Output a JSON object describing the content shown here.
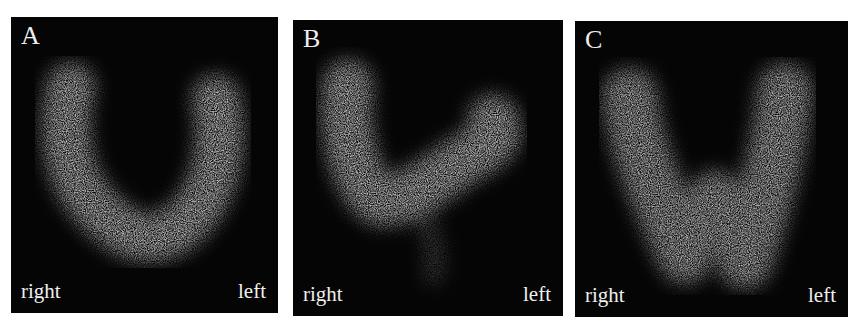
{
  "figure": {
    "panels": [
      {
        "id": "A",
        "label": "A",
        "side_left_label": "right",
        "side_right_label": "left",
        "shape": "symmetric V/U-shaped thyroid uptake"
      },
      {
        "id": "B",
        "label": "B",
        "side_left_label": "right",
        "side_right_label": "left",
        "shape": "asymmetric tilted V, right lobe elevated"
      },
      {
        "id": "C",
        "label": "C",
        "side_left_label": "right",
        "side_right_label": "left",
        "shape": "butterfly-shaped diffuse uptake"
      }
    ],
    "colors": {
      "background": "#ffffff",
      "panel": "#050505",
      "uptake": "#c8c8c8",
      "text": "#eeeeee"
    }
  }
}
